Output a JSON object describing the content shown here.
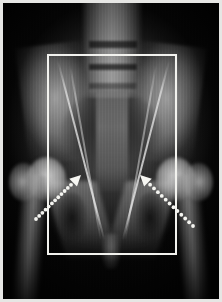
{
  "figure": {
    "kind": "radiograph",
    "modality_label": "X-ray",
    "body_region": "pelvis / bilateral hips",
    "view": "anteroposterior",
    "caption": "",
    "background_color": "#050505",
    "frame_color": "#e6e6e4"
  },
  "annotations": {
    "roi_box": {
      "name": "region-of-interest-box",
      "color": "#f2f2ee",
      "stroke_width": 2,
      "x": 47,
      "y": 54,
      "width": 130,
      "height": 201
    },
    "arrows": [
      {
        "name": "left-dotted-arrow",
        "color": "#f4f4f0",
        "style": "dotted",
        "dot_count": 12,
        "tail_x": 36,
        "tail_y": 219,
        "tip_x": 81,
        "tip_y": 175,
        "points_to": "left femoral neck",
        "direction": "up-right"
      },
      {
        "name": "right-dotted-arrow",
        "color": "#f4f4f0",
        "style": "dotted",
        "dot_count": 12,
        "tail_x": 193,
        "tail_y": 226,
        "tip_x": 140,
        "tip_y": 175,
        "points_to": "right femoral neck",
        "direction": "up-left"
      }
    ]
  },
  "anatomy_labels": {
    "spine": "lumbosacral spine",
    "ilium_left": "left iliac wing",
    "ilium_right": "right iliac wing",
    "sacrum": "sacrum",
    "femoral_head_left": "left femoral head",
    "femoral_head_right": "right femoral head",
    "obturator_left": "left obturator foramen",
    "obturator_right": "right obturator foramen",
    "symphysis": "pubic symphysis"
  }
}
